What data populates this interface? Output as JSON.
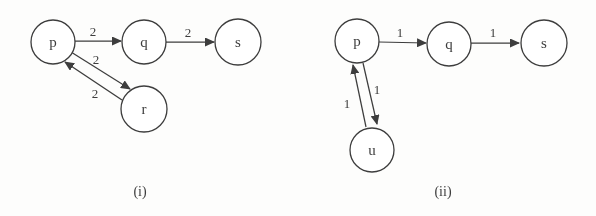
{
  "figure": {
    "width": 596,
    "height": 216,
    "background": "#fdfdfc",
    "ink": "#3d3d3d",
    "node_fill": "#ffffff"
  },
  "graphs": [
    {
      "id": "i",
      "caption": "(i)",
      "caption_x": 140,
      "caption_y": 196,
      "nodes": [
        {
          "id": "p",
          "label": "p",
          "x": 53,
          "y": 42,
          "r": 22
        },
        {
          "id": "q",
          "label": "q",
          "x": 144,
          "y": 42,
          "r": 22
        },
        {
          "id": "s",
          "label": "s",
          "x": 238,
          "y": 42,
          "r": 23
        },
        {
          "id": "r",
          "label": "r",
          "x": 144,
          "y": 109,
          "r": 23
        }
      ],
      "edges": [
        {
          "from": "p",
          "to": "q",
          "weight": "2",
          "x1": 75,
          "y1": 41,
          "x2": 121,
          "y2": 41,
          "lx": 93,
          "ly": 36
        },
        {
          "from": "q",
          "to": "s",
          "weight": "2",
          "x1": 166,
          "y1": 42,
          "x2": 214,
          "y2": 42,
          "lx": 188,
          "ly": 37
        },
        {
          "from": "p",
          "to": "r",
          "weight": "2",
          "x1": 71,
          "y1": 52,
          "x2": 130,
          "y2": 89,
          "lx": 96,
          "ly": 64
        },
        {
          "from": "r",
          "to": "p",
          "weight": "2",
          "x1": 122,
          "y1": 100,
          "x2": 65,
          "y2": 62,
          "lx": 95,
          "ly": 98
        }
      ]
    },
    {
      "id": "ii",
      "caption": "(ii)",
      "caption_x": 443,
      "caption_y": 196,
      "nodes": [
        {
          "id": "p",
          "label": "p",
          "x": 357,
          "y": 41,
          "r": 22
        },
        {
          "id": "q",
          "label": "q",
          "x": 449,
          "y": 44,
          "r": 22
        },
        {
          "id": "s",
          "label": "s",
          "x": 544,
          "y": 43,
          "r": 23
        },
        {
          "id": "u",
          "label": "u",
          "x": 372,
          "y": 150,
          "r": 22
        }
      ],
      "edges": [
        {
          "from": "p",
          "to": "q",
          "weight": "1",
          "x1": 379,
          "y1": 42,
          "x2": 426,
          "y2": 43,
          "lx": 400,
          "ly": 37
        },
        {
          "from": "q",
          "to": "s",
          "weight": "1",
          "x1": 471,
          "y1": 43,
          "x2": 519,
          "y2": 43,
          "lx": 493,
          "ly": 37
        },
        {
          "from": "u",
          "to": "p",
          "weight": "1",
          "x1": 366,
          "y1": 127,
          "x2": 353,
          "y2": 65,
          "lx": 347,
          "ly": 108
        },
        {
          "from": "p",
          "to": "u",
          "weight": "1",
          "x1": 363,
          "y1": 63,
          "x2": 377,
          "y2": 124,
          "lx": 377,
          "ly": 94
        }
      ]
    }
  ]
}
